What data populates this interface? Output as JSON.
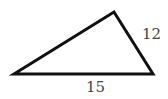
{
  "diagram": {
    "type": "triangle",
    "vertices": {
      "left": [
        14,
        74
      ],
      "top": [
        114,
        12
      ],
      "right": [
        153,
        74
      ]
    },
    "stroke_color": "#111111",
    "label_color": "#444444",
    "labels": {
      "right_side": "12",
      "base": "15"
    }
  }
}
